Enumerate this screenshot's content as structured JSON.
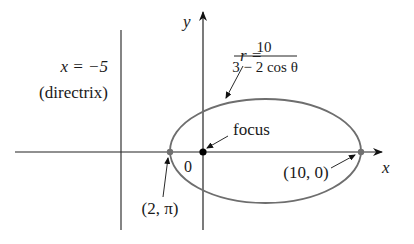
{
  "figure": {
    "axes": {
      "x_label": "x",
      "y_label": "y",
      "origin_label": "0"
    },
    "directrix": {
      "equation": "x = −5",
      "caption": "(directrix)"
    },
    "equation": {
      "lhs": "r =",
      "numerator": "10",
      "denominator": "3 − 2 cos θ"
    },
    "focus_label": "focus",
    "points": [
      {
        "label": "(2, π)",
        "role": "left vertex"
      },
      {
        "label": "(10, 0)",
        "role": "right vertex"
      }
    ],
    "colors": {
      "curve": "#6e6e6e",
      "axes": "#222222",
      "focus": "#000000",
      "vertex": "#707070"
    }
  }
}
